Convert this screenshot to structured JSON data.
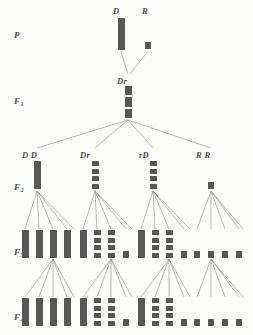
{
  "figure": {
    "bar_color": "#575757",
    "line_color": "#8a8a8a",
    "background": "#fdfdfc"
  },
  "row_labels": [
    {
      "id": "P",
      "text": "P",
      "sub": "",
      "x": 14,
      "y": 30
    },
    {
      "id": "F1",
      "text": "F",
      "sub": "1",
      "x": 14,
      "y": 96
    },
    {
      "id": "F2",
      "text": "F",
      "sub": "2",
      "x": 14,
      "y": 182
    },
    {
      "id": "F3",
      "text": "F",
      "sub": "3",
      "x": 14,
      "y": 247
    },
    {
      "id": "F4",
      "text": "F",
      "sub": "4",
      "x": 14,
      "y": 312
    }
  ],
  "node_labels": [
    {
      "id": "D",
      "text": "D",
      "x": 113,
      "y": 6
    },
    {
      "id": "R",
      "text": "R",
      "x": 142,
      "y": 6
    },
    {
      "id": "Dr",
      "text": "Dr",
      "x": 117,
      "y": 76
    },
    {
      "id": "DD",
      "text": "D D",
      "x": 22,
      "y": 150
    },
    {
      "id": "Dr2",
      "text": "Dr",
      "x": 80,
      "y": 150
    },
    {
      "id": "rD",
      "text": "rD",
      "x": 139,
      "y": 150
    },
    {
      "id": "RR",
      "text": "R R",
      "x": 196,
      "y": 150
    }
  ],
  "generations": {
    "P": {
      "label": "P",
      "nodes": [
        {
          "name": "D",
          "x": 118,
          "y": 18,
          "width": 7,
          "height": 32,
          "style": "solid"
        },
        {
          "name": "R",
          "x": 145,
          "y": 42,
          "width": 6,
          "height": 7,
          "style": "solid"
        }
      ]
    },
    "F1": {
      "label": "F1",
      "nodes": [
        {
          "name": "Dr",
          "x": 125,
          "y": 86,
          "width": 7,
          "height": 32,
          "style": "segmented",
          "segments": 3
        }
      ]
    },
    "F2": {
      "label": "F2",
      "nodes": [
        {
          "name": "DD",
          "x": 34,
          "y": 161,
          "width": 7,
          "height": 28,
          "style": "solid"
        },
        {
          "name": "Dr",
          "x": 92,
          "y": 161,
          "width": 7,
          "height": 28,
          "style": "segmented",
          "segments": 4
        },
        {
          "name": "rD",
          "x": 150,
          "y": 161,
          "width": 7,
          "height": 28,
          "style": "segmented",
          "segments": 4
        },
        {
          "name": "RR",
          "x": 208,
          "y": 182,
          "width": 6,
          "height": 7,
          "style": "solid"
        }
      ]
    },
    "F3": {
      "label": "F3",
      "groups": [
        {
          "parent": "DD",
          "bars": [
            {
              "x": 22,
              "y": 230,
              "width": 7,
              "height": 28,
              "style": "solid"
            },
            {
              "x": 36,
              "y": 230,
              "width": 7,
              "height": 28,
              "style": "solid"
            },
            {
              "x": 50,
              "y": 230,
              "width": 7,
              "height": 28,
              "style": "solid"
            },
            {
              "x": 64,
              "y": 230,
              "width": 7,
              "height": 28,
              "style": "solid"
            }
          ]
        },
        {
          "parent": "Dr",
          "bars": [
            {
              "x": 80,
              "y": 230,
              "width": 7,
              "height": 28,
              "style": "solid"
            },
            {
              "x": 94,
              "y": 230,
              "width": 7,
              "height": 28,
              "style": "segmented",
              "segments": 4
            },
            {
              "x": 108,
              "y": 230,
              "width": 7,
              "height": 28,
              "style": "segmented",
              "segments": 4
            },
            {
              "x": 123,
              "y": 251,
              "width": 6,
              "height": 7,
              "style": "solid"
            }
          ]
        },
        {
          "parent": "rD",
          "bars": [
            {
              "x": 138,
              "y": 230,
              "width": 7,
              "height": 28,
              "style": "solid"
            },
            {
              "x": 152,
              "y": 230,
              "width": 7,
              "height": 28,
              "style": "segmented",
              "segments": 4
            },
            {
              "x": 166,
              "y": 230,
              "width": 7,
              "height": 28,
              "style": "segmented",
              "segments": 4
            },
            {
              "x": 181,
              "y": 251,
              "width": 6,
              "height": 7,
              "style": "solid"
            }
          ]
        },
        {
          "parent": "RR",
          "bars": [
            {
              "x": 194,
              "y": 251,
              "width": 6,
              "height": 7,
              "style": "solid"
            },
            {
              "x": 208,
              "y": 251,
              "width": 6,
              "height": 7,
              "style": "solid"
            },
            {
              "x": 222,
              "y": 251,
              "width": 6,
              "height": 7,
              "style": "solid"
            },
            {
              "x": 236,
              "y": 251,
              "width": 6,
              "height": 7,
              "style": "solid"
            }
          ]
        }
      ]
    },
    "F4": {
      "label": "F4",
      "groups": [
        {
          "parent": "DD",
          "bars": [
            {
              "x": 22,
              "y": 298,
              "width": 7,
              "height": 28,
              "style": "solid"
            },
            {
              "x": 36,
              "y": 298,
              "width": 7,
              "height": 28,
              "style": "solid"
            },
            {
              "x": 50,
              "y": 298,
              "width": 7,
              "height": 28,
              "style": "solid"
            },
            {
              "x": 64,
              "y": 298,
              "width": 7,
              "height": 28,
              "style": "solid"
            }
          ]
        },
        {
          "parent": "Dr",
          "bars": [
            {
              "x": 80,
              "y": 298,
              "width": 7,
              "height": 28,
              "style": "solid"
            },
            {
              "x": 94,
              "y": 298,
              "width": 7,
              "height": 28,
              "style": "segmented",
              "segments": 4
            },
            {
              "x": 108,
              "y": 298,
              "width": 7,
              "height": 28,
              "style": "segmented",
              "segments": 4
            },
            {
              "x": 123,
              "y": 319,
              "width": 6,
              "height": 7,
              "style": "solid"
            }
          ]
        },
        {
          "parent": "rD",
          "bars": [
            {
              "x": 138,
              "y": 298,
              "width": 7,
              "height": 28,
              "style": "solid"
            },
            {
              "x": 152,
              "y": 298,
              "width": 7,
              "height": 28,
              "style": "segmented",
              "segments": 4
            },
            {
              "x": 166,
              "y": 298,
              "width": 7,
              "height": 28,
              "style": "segmented",
              "segments": 4
            },
            {
              "x": 181,
              "y": 319,
              "width": 6,
              "height": 7,
              "style": "solid"
            }
          ]
        },
        {
          "parent": "RR",
          "bars": [
            {
              "x": 194,
              "y": 319,
              "width": 6,
              "height": 7,
              "style": "solid"
            },
            {
              "x": 208,
              "y": 319,
              "width": 6,
              "height": 7,
              "style": "solid"
            },
            {
              "x": 222,
              "y": 319,
              "width": 6,
              "height": 7,
              "style": "solid"
            },
            {
              "x": 236,
              "y": 319,
              "width": 6,
              "height": 7,
              "style": "solid"
            }
          ]
        }
      ]
    }
  },
  "connections": {
    "p_to_f1": [
      {
        "from": [
          121,
          52
        ],
        "to": [
          128,
          74
        ]
      },
      {
        "from": [
          148,
          51
        ],
        "to": [
          130,
          74
        ]
      }
    ],
    "f1_to_f2": [
      {
        "from": [
          128,
          120
        ],
        "to": [
          37,
          148
        ]
      },
      {
        "from": [
          128,
          120
        ],
        "to": [
          95,
          148
        ]
      },
      {
        "from": [
          128,
          120
        ],
        "to": [
          153,
          148
        ]
      },
      {
        "from": [
          128,
          120
        ],
        "to": [
          211,
          148
        ]
      }
    ],
    "f2_to_f3_fan_targets": [
      {
        "origin": [
          37,
          191
        ],
        "targets": [
          25,
          39,
          53,
          67,
          74
        ]
      },
      {
        "origin": [
          95,
          191
        ],
        "targets": [
          83,
          97,
          111,
          126,
          132
        ]
      },
      {
        "origin": [
          153,
          191
        ],
        "targets": [
          141,
          155,
          169,
          184,
          190
        ]
      },
      {
        "origin": [
          211,
          191
        ],
        "targets": [
          197,
          211,
          225,
          239,
          243
        ]
      }
    ],
    "f3_to_f4_fan_targets": [
      {
        "origin": [
          53,
          259
        ],
        "targets": [
          25,
          39,
          53,
          67,
          74
        ]
      },
      {
        "origin": [
          111,
          259
        ],
        "targets": [
          83,
          97,
          111,
          126,
          132
        ]
      },
      {
        "origin": [
          169,
          259
        ],
        "targets": [
          141,
          155,
          169,
          184,
          190
        ]
      },
      {
        "origin": [
          211,
          259
        ],
        "targets": [
          197,
          211,
          225,
          239,
          243
        ]
      }
    ]
  }
}
